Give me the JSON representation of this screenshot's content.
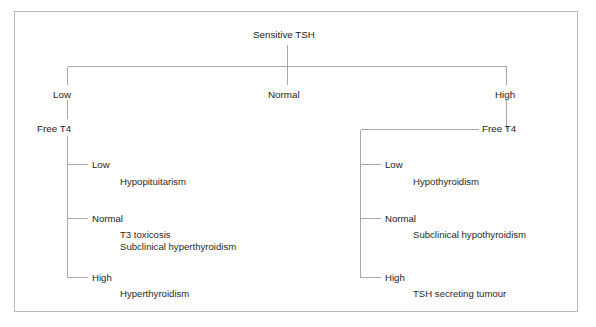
{
  "figure": {
    "root": {
      "label": "Sensitive TSH"
    },
    "branches": [
      {
        "id": "low",
        "label": "Low",
        "child_label": "Free T4",
        "groups": [
          {
            "label": "Low",
            "items": [
              "Hypopituitarism"
            ]
          },
          {
            "label": "Normal",
            "items": [
              "T3 toxicosis",
              "Subclinical hyperthyroidism"
            ]
          },
          {
            "label": "High",
            "items": [
              "Hyperthyroidism"
            ]
          }
        ]
      },
      {
        "id": "normal",
        "label": "Normal",
        "child_label": null,
        "groups": []
      },
      {
        "id": "high",
        "label": "High",
        "child_label": "Free T4",
        "groups": [
          {
            "label": "Low",
            "items": [
              "Hypothyroidism"
            ]
          },
          {
            "label": "Normal",
            "items": [
              "Subclinical hypothyroidism"
            ]
          },
          {
            "label": "High",
            "items": [
              "TSH secreting tumour"
            ]
          }
        ]
      }
    ]
  },
  "colors": {
    "line": "#a8a8a8",
    "frame": "#b9b9b9",
    "text": "#222222",
    "background": "#ffffff"
  }
}
